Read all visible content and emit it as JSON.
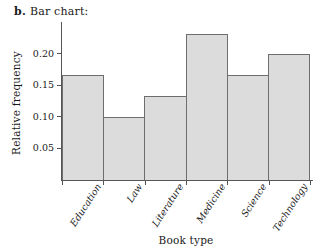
{
  "caption": {
    "label": "b.",
    "text": "Bar chart:"
  },
  "chart_data": {
    "type": "bar",
    "title": "Bar chart:",
    "categories": [
      "Education",
      "Law",
      "Literature",
      "Medicine",
      "Science",
      "Technology"
    ],
    "values": [
      0.167,
      0.1,
      0.133,
      0.233,
      0.167,
      0.2
    ],
    "xlabel": "Book type",
    "ylabel": "Relative frequency",
    "ylim": [
      0,
      0.245
    ],
    "yticks": [
      0.05,
      0.1,
      0.15,
      0.2
    ],
    "ytick_labels": [
      "0.05",
      "0.10",
      "0.15",
      "0.20"
    ],
    "grid": false,
    "legend": null,
    "bar_fill_color": "#dcdcdc",
    "bar_edge_color": "#6e6e6e",
    "axis_color": "#555555",
    "bars_touch": true
  }
}
